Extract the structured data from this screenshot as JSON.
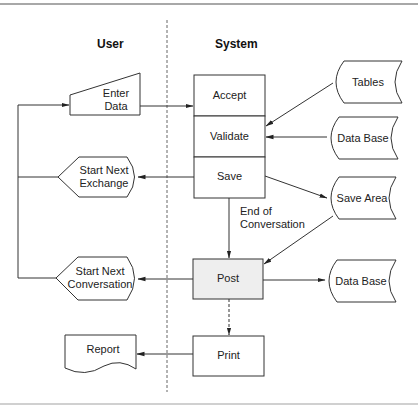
{
  "lanes": {
    "user": "User",
    "system": "System"
  },
  "colors": {
    "stroke": "#333333",
    "post_fill": "#eeeeee",
    "rule": "#a8a8a8",
    "divider": "#666666"
  },
  "nodes": {
    "enter_data": {
      "shape": "manual-input",
      "label_line1": "Enter",
      "label_line2": "Data"
    },
    "start_next_exchange": {
      "shape": "display",
      "label_line1": "Start Next",
      "label_line2": "Exchange"
    },
    "start_next_conversation": {
      "shape": "display",
      "label_line1": "Start Next",
      "label_line2": "Conversation"
    },
    "report": {
      "shape": "document",
      "label": "Report"
    },
    "accept": {
      "shape": "process",
      "label": "Accept"
    },
    "validate": {
      "shape": "process",
      "label": "Validate"
    },
    "save": {
      "shape": "process",
      "label": "Save"
    },
    "post": {
      "shape": "process",
      "label": "Post"
    },
    "print": {
      "shape": "process",
      "label": "Print"
    },
    "tables": {
      "shape": "stored-data",
      "label": "Tables"
    },
    "data_base_1": {
      "shape": "stored-data",
      "label": "Data Base"
    },
    "save_area": {
      "shape": "stored-data",
      "label": "Save Area"
    },
    "data_base_2": {
      "shape": "stored-data",
      "label": "Data Base"
    }
  },
  "edge_labels": {
    "end_of_conversation_line1": "End of",
    "end_of_conversation_line2": "Conversation"
  },
  "edges": [
    {
      "from": "Enter Data",
      "to": "Accept",
      "style": "solid"
    },
    {
      "from": "Tables",
      "to": "Validate",
      "style": "solid"
    },
    {
      "from": "Data Base",
      "to": "Validate",
      "style": "solid"
    },
    {
      "from": "Save",
      "to": "Start Next Exchange",
      "style": "solid"
    },
    {
      "from": "Save",
      "to": "Save Area",
      "style": "solid"
    },
    {
      "from": "Save",
      "to": "Post",
      "style": "solid",
      "label": "End of Conversation"
    },
    {
      "from": "Save Area",
      "to": "Post",
      "style": "solid"
    },
    {
      "from": "Post",
      "to": "Data Base",
      "style": "solid"
    },
    {
      "from": "Post",
      "to": "Start Next Conversation",
      "style": "solid"
    },
    {
      "from": "Post",
      "to": "Print",
      "style": "dashed"
    },
    {
      "from": "Print",
      "to": "Report",
      "style": "solid"
    },
    {
      "from": "Start Next Exchange",
      "to": "Enter Data",
      "style": "solid"
    },
    {
      "from": "Start Next Conversation",
      "to": "Enter Data",
      "style": "solid"
    }
  ]
}
